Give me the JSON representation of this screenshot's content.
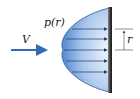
{
  "diagram": {
    "velocity_label": "V",
    "pressure_label": "p(r)",
    "radius_label": "r",
    "colors": {
      "velocity_arrow": "#2f6db5",
      "profile_fill_edge": "#6f9fdc",
      "profile_fill_center": "#eaf2fc",
      "profile_outline": "#2a5aa0",
      "pressure_arrows": "#1e3a66",
      "plate": "#4a4a4a"
    },
    "pressure_arrow_count": 5
  }
}
